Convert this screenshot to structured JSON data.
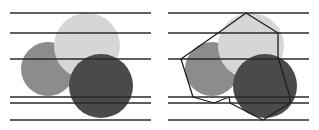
{
  "figure": {
    "colors": {
      "background": "#ffffff",
      "line": "#2a2a2a",
      "circle_medium": "#8c8c8c",
      "circle_light": "#d6d6d6",
      "circle_dark": "#4a4a4a",
      "polygon_stroke": "#1e1e1e"
    },
    "horizontal_lines_y": [
      13,
      33,
      59,
      97,
      103,
      120
    ],
    "panels": [
      {
        "id": "left",
        "line_x": [
          10,
          151
        ],
        "circles": [
          {
            "name": "medium",
            "cx": 48,
            "cy": 69,
            "r": 27
          },
          {
            "name": "light",
            "cx": 87,
            "cy": 46,
            "r": 33
          },
          {
            "name": "dark",
            "cx": 101,
            "cy": 86,
            "r": 32
          }
        ]
      },
      {
        "id": "right",
        "line_x": [
          168,
          309
        ],
        "circles": [
          {
            "name": "medium",
            "cx": 212,
            "cy": 69,
            "r": 27
          },
          {
            "name": "light",
            "cx": 251,
            "cy": 46,
            "r": 33
          },
          {
            "name": "dark",
            "cx": 265,
            "cy": 86,
            "r": 32
          }
        ],
        "polygons": [
          {
            "name": "light-hexagon",
            "points": "218,33 246,13 278,33 278,59"
          },
          {
            "name": "outer-left-edge",
            "points": "218,33 181,59 193,97 214,103 229,97"
          },
          {
            "name": "dark-hexagon",
            "points": "278,57 290,97 290,103 263,120 230,103 229,97"
          }
        ]
      }
    ]
  }
}
